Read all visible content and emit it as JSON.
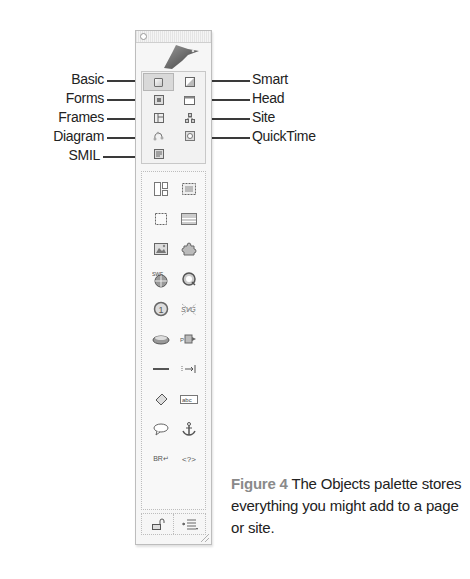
{
  "palette": {
    "tabs": [
      {
        "label": "Basic",
        "side": "left",
        "row": 0,
        "col": 0,
        "active": true,
        "icon": "basic-tab-icon"
      },
      {
        "label": "Smart",
        "side": "right",
        "row": 0,
        "col": 1,
        "active": false,
        "icon": "smart-tab-icon"
      },
      {
        "label": "Forms",
        "side": "left",
        "row": 1,
        "col": 0,
        "active": false,
        "icon": "forms-tab-icon"
      },
      {
        "label": "Head",
        "side": "right",
        "row": 1,
        "col": 1,
        "active": false,
        "icon": "head-tab-icon"
      },
      {
        "label": "Frames",
        "side": "left",
        "row": 2,
        "col": 0,
        "active": false,
        "icon": "frames-tab-icon"
      },
      {
        "label": "Site",
        "side": "right",
        "row": 2,
        "col": 1,
        "active": false,
        "icon": "site-tab-icon"
      },
      {
        "label": "Diagram",
        "side": "left",
        "row": 3,
        "col": 0,
        "active": false,
        "icon": "diagram-tab-icon"
      },
      {
        "label": "QuickTime",
        "side": "right",
        "row": 3,
        "col": 1,
        "active": false,
        "icon": "quicktime-tab-icon"
      },
      {
        "label": "SMIL",
        "side": "left",
        "row": 4,
        "col": 0,
        "active": false,
        "icon": "smil-tab-icon"
      }
    ],
    "objects": [
      {
        "name": "layout-grid-icon",
        "row": 0,
        "col": 0
      },
      {
        "name": "table-icon",
        "row": 0,
        "col": 1
      },
      {
        "name": "box-icon",
        "row": 1,
        "col": 0
      },
      {
        "name": "layout-rows-icon",
        "row": 1,
        "col": 1
      },
      {
        "name": "image-icon",
        "row": 2,
        "col": 0
      },
      {
        "name": "plugin-puzzle-icon",
        "row": 2,
        "col": 1
      },
      {
        "name": "swf-icon",
        "row": 3,
        "col": 0,
        "text": "SWF"
      },
      {
        "name": "quicktime-icon",
        "row": 3,
        "col": 1
      },
      {
        "name": "counter-icon",
        "row": 4,
        "col": 0,
        "text": "1"
      },
      {
        "name": "svg-icon",
        "row": 4,
        "col": 1,
        "text": "SVG"
      },
      {
        "name": "soap-icon",
        "row": 5,
        "col": 0
      },
      {
        "name": "action-icon",
        "row": 5,
        "col": 1
      },
      {
        "name": "horizontal-rule-icon",
        "row": 6,
        "col": 0
      },
      {
        "name": "tab-marker-icon",
        "row": 6,
        "col": 1,
        "text": "|→|"
      },
      {
        "name": "eraser-icon",
        "row": 7,
        "col": 0
      },
      {
        "name": "text-field-icon",
        "row": 7,
        "col": 1
      },
      {
        "name": "comment-icon",
        "row": 8,
        "col": 0
      },
      {
        "name": "anchor-icon",
        "row": 8,
        "col": 1,
        "text": "⚓"
      },
      {
        "name": "line-break-icon",
        "row": 9,
        "col": 0,
        "text": "BR↵"
      },
      {
        "name": "script-tag-icon",
        "row": 9,
        "col": 1,
        "text": "<?>"
      }
    ],
    "bottom_buttons": [
      {
        "name": "lock-toggle-button",
        "icon": "lock-icon"
      },
      {
        "name": "palette-menu-button",
        "icon": "menu-list-icon"
      }
    ]
  },
  "caption": {
    "figure_label": "Figure 4",
    "text": " The Objects palette stores everything you might add to a page or site."
  },
  "colors": {
    "text": "#222222",
    "figure_label": "#8a8a8a",
    "palette_bg": "#f6f6f6",
    "leader": "#3a3a3a"
  }
}
